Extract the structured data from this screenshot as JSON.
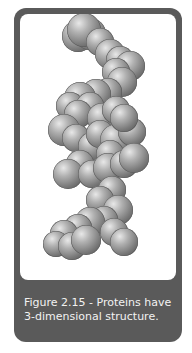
{
  "figure": {
    "caption_line1": "Figure 2.15 - Proteins have",
    "caption_line2": "3-dimensional structure.",
    "illustration": "protein-alpha-helix-spheres"
  },
  "colors": {
    "frame": "#5a5a5a",
    "background": "#ffffff",
    "caption_text": "#f2f2f2"
  },
  "spheres": [
    [
      58,
      22,
      16
    ],
    [
      70,
      20,
      16
    ],
    [
      64,
      16,
      17
    ],
    [
      80,
      28,
      14
    ],
    [
      90,
      40,
      15
    ],
    [
      100,
      46,
      14
    ],
    [
      110,
      52,
      15
    ],
    [
      96,
      58,
      14
    ],
    [
      102,
      68,
      15
    ],
    [
      88,
      78,
      14
    ],
    [
      76,
      80,
      15
    ],
    [
      60,
      84,
      16
    ],
    [
      50,
      92,
      14
    ],
    [
      70,
      92,
      14
    ],
    [
      58,
      100,
      14
    ],
    [
      82,
      104,
      15
    ],
    [
      96,
      96,
      14
    ],
    [
      44,
      116,
      16
    ],
    [
      56,
      124,
      14
    ],
    [
      72,
      132,
      14
    ],
    [
      80,
      120,
      14
    ],
    [
      96,
      126,
      16
    ],
    [
      112,
      118,
      14
    ],
    [
      104,
      104,
      14
    ],
    [
      90,
      140,
      14
    ],
    [
      60,
      150,
      14
    ],
    [
      48,
      160,
      15
    ],
    [
      72,
      160,
      14
    ],
    [
      88,
      154,
      15
    ],
    [
      104,
      150,
      14
    ],
    [
      114,
      144,
      15
    ],
    [
      92,
      176,
      14
    ],
    [
      80,
      186,
      14
    ],
    [
      98,
      196,
      15
    ],
    [
      84,
      206,
      14
    ],
    [
      70,
      208,
      15
    ],
    [
      58,
      214,
      14
    ],
    [
      44,
      220,
      14
    ],
    [
      36,
      230,
      13
    ],
    [
      52,
      232,
      14
    ],
    [
      66,
      226,
      15
    ],
    [
      94,
      218,
      14
    ],
    [
      104,
      228,
      14
    ]
  ]
}
